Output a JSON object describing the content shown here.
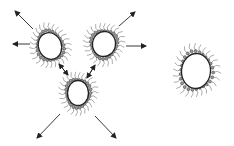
{
  "diagram": {
    "title": "",
    "clusters": [
      {
        "id": "cluster-top-left",
        "cx": 50,
        "cy": 46,
        "rx": 13,
        "ry": 15,
        "tilt": -20
      },
      {
        "id": "cluster-top-right",
        "cx": 104,
        "cy": 44,
        "rx": 13,
        "ry": 14,
        "tilt": 10
      },
      {
        "id": "cluster-bottom",
        "cx": 78,
        "cy": 93,
        "rx": 12,
        "ry": 14,
        "tilt": 0
      },
      {
        "id": "cluster-right",
        "cx": 196,
        "cy": 71,
        "rx": 16,
        "ry": 19,
        "tilt": 5
      }
    ],
    "arrows": [
      {
        "x1": 33,
        "y1": 29,
        "x2": 15,
        "y2": 11
      },
      {
        "x1": 30,
        "y1": 44,
        "x2": 13,
        "y2": 44
      },
      {
        "x1": 119,
        "y1": 26,
        "x2": 135,
        "y2": 12
      },
      {
        "x1": 126,
        "y1": 46,
        "x2": 146,
        "y2": 46
      },
      {
        "x1": 59,
        "y1": 64,
        "x2": 68,
        "y2": 75
      },
      {
        "x1": 68,
        "y1": 75,
        "x2": 59,
        "y2": 64
      },
      {
        "x1": 95,
        "y1": 65,
        "x2": 87,
        "y2": 78
      },
      {
        "x1": 87,
        "y1": 78,
        "x2": 95,
        "y2": 65
      },
      {
        "x1": 60,
        "y1": 114,
        "x2": 37,
        "y2": 138
      },
      {
        "x1": 95,
        "y1": 116,
        "x2": 116,
        "y2": 138
      }
    ],
    "colors": {
      "line": "#222222",
      "tails": "#8a8a8a",
      "head": "#9a9a9a"
    }
  }
}
